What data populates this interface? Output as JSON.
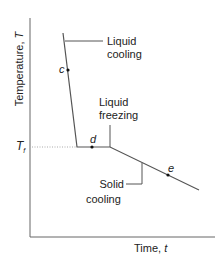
{
  "diagram": {
    "axes": {
      "y_label": "Temperature, ",
      "y_symbol": "T",
      "x_label": "Time, ",
      "x_symbol": "t"
    },
    "reference_line": {
      "label": "T",
      "subscript": "f",
      "style": "dotted"
    },
    "points": [
      {
        "label": "c"
      },
      {
        "label": "d"
      },
      {
        "label": "e"
      }
    ],
    "annotations": {
      "liquid_cooling": [
        "Liquid",
        "cooling"
      ],
      "liquid_freezing": [
        "Liquid",
        "freezing"
      ],
      "solid_cooling": [
        "Solid",
        "cooling"
      ]
    },
    "colors": {
      "line": "#555555",
      "text": "#222222",
      "dotted": "#aaaaaa"
    }
  }
}
